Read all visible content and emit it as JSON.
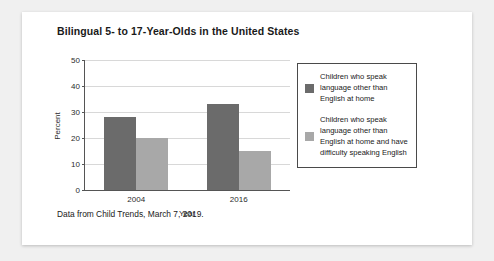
{
  "chart_data": {
    "type": "bar",
    "title": "Bilingual 5- to 17-Year-Olds in the United States",
    "xlabel": "Year",
    "ylabel": "Percent",
    "categories": [
      "2004",
      "2016"
    ],
    "series": [
      {
        "name": "Children who speak language other than English at home",
        "values": [
          28,
          33
        ],
        "color": "#6b6b6b"
      },
      {
        "name": "Children who speak language other than English at home and have difficulty speaking English",
        "values": [
          20,
          15
        ],
        "color": "#a8a8a8"
      }
    ],
    "ylim": [
      0,
      50
    ],
    "yticks": [
      0,
      10,
      20,
      30,
      40,
      50
    ],
    "grid": true,
    "legend_position": "right",
    "caption": "Data from Child Trends, March 7, 2019."
  }
}
